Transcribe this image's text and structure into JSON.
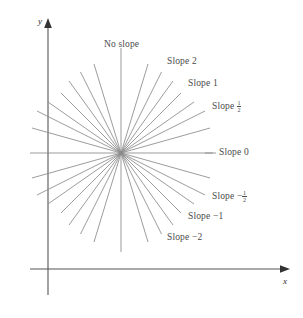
{
  "figure": {
    "type": "slope-fan-diagram",
    "background": "#ffffff",
    "line_color": "#8a8a8a",
    "axis_color": "#555555",
    "text_color": "#4a4a4a",
    "origin": {
      "x": 121,
      "y": 153
    },
    "axes": {
      "x_axis": {
        "y": 269,
        "x_start": 30,
        "x_end": 290,
        "label": "x"
      },
      "y_axis": {
        "x": 48,
        "y_start": 20,
        "y_end": 295,
        "label": "y"
      }
    },
    "labels": {
      "no_slope": "No slope",
      "slope_2": "Slope 2",
      "slope_1": "Slope 1",
      "slope_half_prefix": "Slope ",
      "slope_half_num": "1",
      "slope_half_den": "2",
      "slope_0": "Slope 0",
      "slope_neg_half_prefix": "Slope −",
      "slope_neg_half_num": "1",
      "slope_neg_half_den": "2",
      "slope_neg_1": "Slope −1",
      "slope_neg_2": "Slope −2"
    },
    "rays": [
      {
        "name": "no-slope",
        "slope": "undefined",
        "label": "No slope"
      },
      {
        "name": "slope-2",
        "slope": 2,
        "label": "Slope 2"
      },
      {
        "name": "slope-1",
        "slope": 1,
        "label": "Slope 1"
      },
      {
        "name": "slope-one-half",
        "slope": 0.5,
        "label": "Slope 1/2"
      },
      {
        "name": "slope-0",
        "slope": 0,
        "label": "Slope 0"
      },
      {
        "name": "slope-neg-one-half",
        "slope": -0.5,
        "label": "Slope -1/2"
      },
      {
        "name": "slope-neg-1",
        "slope": -1,
        "label": "Slope -1"
      },
      {
        "name": "slope-neg-2",
        "slope": -2,
        "label": "Slope -2"
      }
    ]
  }
}
